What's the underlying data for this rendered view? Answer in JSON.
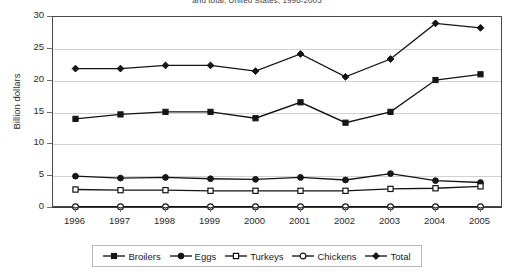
{
  "chart": {
    "title": "and total, United States, 1996-2005",
    "ylabel": "Billion dollars"
  },
  "chart_data": {
    "type": "line",
    "title": "and total, United States, 1996-2005",
    "xlabel": "",
    "ylabel": "Billion dollars",
    "ylim": [
      0,
      30
    ],
    "yticks": [
      0,
      5,
      10,
      15,
      20,
      25,
      30
    ],
    "grid": true,
    "legend_position": "bottom",
    "categories": [
      "1996",
      "1997",
      "1998",
      "1999",
      "2000",
      "2001",
      "2002",
      "2003",
      "2004",
      "2005"
    ],
    "series": [
      {
        "name": "Broilers",
        "marker": "filled-square",
        "values": [
          14.0,
          14.7,
          15.1,
          15.1,
          14.1,
          16.6,
          13.4,
          15.1,
          20.1,
          21.0
        ]
      },
      {
        "name": "Eggs",
        "marker": "filled-circle",
        "values": [
          5.0,
          4.7,
          4.8,
          4.6,
          4.5,
          4.8,
          4.4,
          5.4,
          4.3,
          4.0
        ]
      },
      {
        "name": "Turkeys",
        "marker": "open-square",
        "values": [
          2.9,
          2.8,
          2.8,
          2.7,
          2.7,
          2.7,
          2.7,
          3.0,
          3.1,
          3.4
        ]
      },
      {
        "name": "Chickens",
        "marker": "open-circle",
        "values": [
          0.2,
          0.2,
          0.2,
          0.2,
          0.2,
          0.2,
          0.2,
          0.2,
          0.2,
          0.2
        ]
      },
      {
        "name": "Total",
        "marker": "filled-diamond",
        "values": [
          21.9,
          21.9,
          22.4,
          22.4,
          21.5,
          24.2,
          20.6,
          23.4,
          29.0,
          28.3
        ]
      }
    ]
  }
}
